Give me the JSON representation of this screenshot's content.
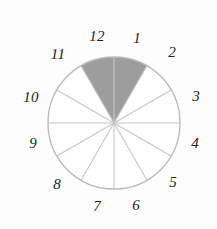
{
  "figure": {
    "background_color": "#fdfdfd"
  },
  "chart_data": {
    "type": "pie",
    "title": "",
    "subtitle": "",
    "xlabel": "",
    "ylabel": "",
    "legend": [],
    "grid": false,
    "center_x": 114,
    "center_y": 123,
    "radius": 66,
    "slice_count": 12,
    "slice_angle_degrees": 30,
    "categories": [
      "1",
      "2",
      "3",
      "4",
      "5",
      "6",
      "7",
      "8",
      "9",
      "10",
      "11",
      "12"
    ],
    "values": [
      30,
      30,
      30,
      30,
      30,
      30,
      30,
      30,
      30,
      30,
      30,
      30
    ],
    "slices": [
      {
        "label": "1",
        "start_angle": 0,
        "end_angle": 30,
        "shaded": true,
        "fill": "#9d9d9d",
        "label_x": 137,
        "label_y": 38
      },
      {
        "label": "2",
        "start_angle": 30,
        "end_angle": 60,
        "shaded": false,
        "fill": "#ffffff",
        "label_x": 172,
        "label_y": 52
      },
      {
        "label": "3",
        "start_angle": 60,
        "end_angle": 90,
        "shaded": false,
        "fill": "#ffffff",
        "label_x": 196,
        "label_y": 96
      },
      {
        "label": "4",
        "start_angle": 90,
        "end_angle": 120,
        "shaded": false,
        "fill": "#ffffff",
        "label_x": 195,
        "label_y": 143
      },
      {
        "label": "5",
        "start_angle": 120,
        "end_angle": 150,
        "shaded": false,
        "fill": "#ffffff",
        "label_x": 173,
        "label_y": 182
      },
      {
        "label": "6",
        "start_angle": 150,
        "end_angle": 180,
        "shaded": false,
        "fill": "#ffffff",
        "label_x": 136,
        "label_y": 205
      },
      {
        "label": "7",
        "start_angle": 180,
        "end_angle": 210,
        "shaded": false,
        "fill": "#ffffff",
        "label_x": 97,
        "label_y": 206
      },
      {
        "label": "8",
        "start_angle": 210,
        "end_angle": 240,
        "shaded": false,
        "fill": "#ffffff",
        "label_x": 57,
        "label_y": 184
      },
      {
        "label": "9",
        "start_angle": 240,
        "end_angle": 270,
        "shaded": false,
        "fill": "#ffffff",
        "label_x": 33,
        "label_y": 143
      },
      {
        "label": "10",
        "start_angle": 270,
        "end_angle": 300,
        "shaded": false,
        "fill": "#ffffff",
        "label_x": 31,
        "label_y": 97
      },
      {
        "label": "11",
        "start_angle": 300,
        "end_angle": 330,
        "shaded": false,
        "fill": "#ffffff",
        "label_x": 58,
        "label_y": 54
      },
      {
        "label": "12",
        "start_angle": 330,
        "end_angle": 360,
        "shaded": true,
        "fill": "#9d9d9d",
        "label_x": 97,
        "label_y": 36
      }
    ],
    "shaded_slices": [
      "12",
      "1"
    ],
    "shaded_total_degrees": 60,
    "colors": {
      "shaded_fill": "#9d9d9d",
      "unshaded_fill": "#ffffff",
      "outline": "#b9b9b9",
      "spoke": "#c6c6c6",
      "label_text": "#25221f",
      "background": "#fdfdfd"
    }
  }
}
